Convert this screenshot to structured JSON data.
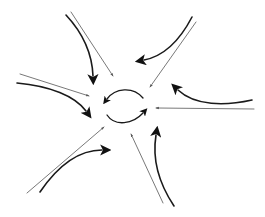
{
  "diagram": {
    "title": "",
    "colors": {
      "background": "#ffffff",
      "thin_arrow": "#555555",
      "thick_arrow": "#1a1a1a"
    },
    "arrow_groups": [
      {
        "position": "top-left",
        "thin": {
          "from": [
            71,
            12
          ],
          "to": [
            113,
            76
          ]
        },
        "thick": {
          "path": "M66 15 C80 30, 92 50, 93 76",
          "tip": [
            93,
            84
          ]
        }
      },
      {
        "position": "top-right",
        "thin": {
          "from": [
            196,
            22
          ],
          "to": [
            150,
            87
          ]
        },
        "thick": {
          "path": "M192 17 C180 40, 165 56, 144 60",
          "tip": [
            136,
            61
          ]
        }
      },
      {
        "position": "right",
        "thin": {
          "from": [
            254,
            109
          ],
          "to": [
            156,
            108
          ]
        },
        "thick": {
          "path": "M252 100 C225 106, 195 106, 178 90",
          "tip": [
            173,
            84
          ]
        }
      },
      {
        "position": "left",
        "thin": {
          "from": [
            20,
            74
          ],
          "to": [
            89,
            96
          ]
        },
        "thick": {
          "path": "M17 83 C50 86, 75 96, 86 111",
          "tip": [
            89,
            118
          ]
        }
      },
      {
        "position": "bottom-left",
        "thin": {
          "from": [
            27,
            193
          ],
          "to": [
            104,
            127
          ]
        },
        "thick": {
          "path": "M40 192 C55 170, 75 150, 102 150",
          "tip": [
            110,
            150
          ]
        }
      },
      {
        "position": "bottom",
        "thin": {
          "from": [
            163,
            203
          ],
          "to": [
            131,
            134
          ]
        },
        "thick": {
          "path": "M174 206 C160 185, 152 160, 156 135",
          "tip": [
            158,
            127
          ]
        }
      }
    ],
    "central_cycle": {
      "top_arc": {
        "path": "M143 98 C133 86, 115 88, 107 99",
        "tip": [
          103,
          103
        ]
      },
      "bottom_arc": {
        "path": "M107 115 C115 127, 133 124, 143 113",
        "tip": [
          148,
          110
        ]
      }
    }
  }
}
